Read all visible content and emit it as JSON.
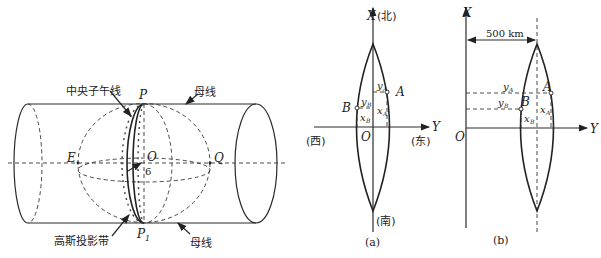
{
  "figure_left": {
    "title": "Gauss projection cylinder",
    "labels": {
      "central_meridian": "中央子午线",
      "generatrix_top": "母线",
      "generatrix_bottom": "母线",
      "gauss_zone": "高斯投影带",
      "P": "P",
      "P1": "P",
      "P1_sub": "1",
      "E": "E",
      "O": "O",
      "Q": "Q",
      "six": "6"
    }
  },
  "figure_a": {
    "caption": "(a)",
    "axis_x": "X",
    "north": "(北)",
    "south": "(南)",
    "west": "(西)",
    "east": "(东)",
    "axis_y": "Y",
    "origin": "O",
    "A": "A",
    "B": "B",
    "yA": "y",
    "yA_sub": "A",
    "xA": "x",
    "xA_sub": "A",
    "yB": "y",
    "yB_sub": "B",
    "xB": "x",
    "xB_sub": "B"
  },
  "figure_b": {
    "caption": "(b)",
    "axis_x": "X",
    "axis_y": "Y",
    "origin": "O",
    "offset": "500 km",
    "A": "A",
    "B": "B",
    "yA": "y",
    "yA_sub": "A",
    "xA": "x",
    "xA_sub": "A",
    "yB": "y",
    "yB_sub": "B",
    "xB": "x",
    "xB_sub": "B"
  }
}
